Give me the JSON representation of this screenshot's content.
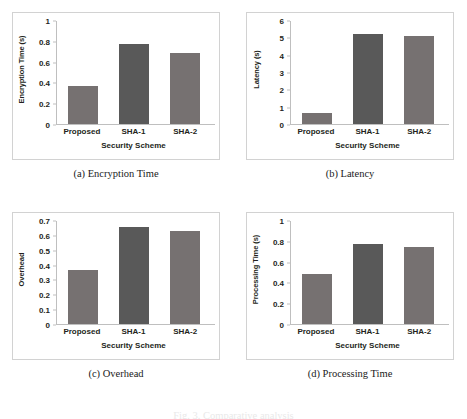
{
  "figure": {
    "bottom_caption": "Fig. 3. Comparative analysis"
  },
  "xlabels": [
    "Proposed",
    "SHA-1",
    "SHA-2"
  ],
  "panels": [
    {
      "caption": "(a) Encryption Time",
      "ylabel": "Encryption Time (s)",
      "xlabel": "Security Scheme"
    },
    {
      "caption": "(b) Latency",
      "ylabel": "Latency (s)",
      "xlabel": "Security Scheme"
    },
    {
      "caption": "(c) Overhead",
      "ylabel": "Overhead",
      "xlabel": "Security Scheme"
    },
    {
      "caption": "(d) Processing Time",
      "ylabel": "Processing Time (s)",
      "xlabel": "Security Scheme"
    }
  ],
  "colors": {
    "bar_light": "#767171",
    "bar_dark": "#595959",
    "axis": "#bfbfbf",
    "panel_border": "#d2d2d2",
    "text": "#231f20"
  },
  "chart_data": [
    {
      "type": "bar",
      "title": "(a) Encryption Time",
      "categories": [
        "Proposed",
        "SHA-1",
        "SHA-2"
      ],
      "values": [
        0.365,
        0.765,
        0.685
      ],
      "xlabel": "Security Scheme",
      "ylabel": "Encryption Time (s)",
      "ylim": [
        0,
        1
      ],
      "yticks": [
        0,
        0.2,
        0.4,
        0.6,
        0.8,
        1
      ],
      "ytick_labels": [
        "0",
        "0.2",
        "0.4",
        "0.6",
        "0.8",
        "1"
      ],
      "grid": false,
      "legend": false
    },
    {
      "type": "bar",
      "title": "(b) Latency",
      "categories": [
        "Proposed",
        "SHA-1",
        "SHA-2"
      ],
      "values": [
        0.65,
        5.2,
        5.1
      ],
      "xlabel": "Security Scheme",
      "ylabel": "Latency (s)",
      "ylim": [
        0,
        6
      ],
      "yticks": [
        0,
        1,
        2,
        3,
        4,
        5,
        6
      ],
      "ytick_labels": [
        "0",
        "1",
        "2",
        "3",
        "4",
        "5",
        "6"
      ],
      "grid": false,
      "legend": false
    },
    {
      "type": "bar",
      "title": "(c) Overhead",
      "categories": [
        "Proposed",
        "SHA-1",
        "SHA-2"
      ],
      "values": [
        0.365,
        0.655,
        0.625
      ],
      "xlabel": "Security Scheme",
      "ylabel": "Overhead",
      "ylim": [
        0,
        0.7
      ],
      "yticks": [
        0,
        0.1,
        0.2,
        0.3,
        0.4,
        0.5,
        0.6,
        0.7
      ],
      "ytick_labels": [
        "0",
        "0.1",
        "0.2",
        "0.3",
        "0.4",
        "0.5",
        "0.6",
        "0.7"
      ],
      "grid": false,
      "legend": false
    },
    {
      "type": "bar",
      "title": "(d) Processing Time",
      "categories": [
        "Proposed",
        "SHA-1",
        "SHA-2"
      ],
      "values": [
        0.485,
        0.765,
        0.745
      ],
      "xlabel": "Security Scheme",
      "ylabel": "Processing Time (s)",
      "ylim": [
        0,
        1
      ],
      "yticks": [
        0,
        0.2,
        0.4,
        0.6,
        0.8,
        1
      ],
      "ytick_labels": [
        "0",
        "0.2",
        "0.4",
        "0.6",
        "0.8",
        "1"
      ],
      "grid": false,
      "legend": false
    }
  ]
}
